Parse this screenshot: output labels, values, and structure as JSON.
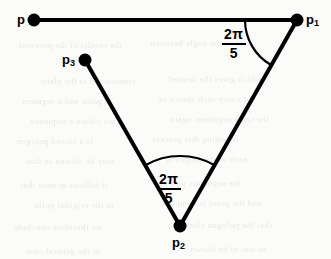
{
  "figure": {
    "background_color": "#fbfbfa",
    "ink_color": "#000000",
    "width": 331,
    "height": 259
  },
  "points": [
    {
      "id": "p",
      "label": "p",
      "subscript": "",
      "x": 34,
      "y": 20,
      "dot_radius": 6.5,
      "label_x": 17,
      "label_y": 13
    },
    {
      "id": "p1",
      "label": "p",
      "subscript": "1",
      "x": 297,
      "y": 20,
      "dot_radius": 6.5,
      "label_x": 306,
      "label_y": 13
    },
    {
      "id": "p3",
      "label": "p",
      "subscript": "3",
      "x": 85,
      "y": 60,
      "dot_radius": 6.5,
      "label_x": 62,
      "label_y": 53
    },
    {
      "id": "p2",
      "label": "p",
      "subscript": "2",
      "x": 180,
      "y": 226,
      "dot_radius": 6.5,
      "label_x": 172,
      "label_y": 236
    }
  ],
  "segments": [
    {
      "id": "p-to-p1",
      "from": "p",
      "to": "p1",
      "x1": 34,
      "y1": 20,
      "x2": 297,
      "y2": 20,
      "stroke_width": 4
    },
    {
      "id": "p1-to-p2",
      "from": "p1",
      "to": "p2",
      "x1": 297,
      "y1": 20,
      "x2": 180,
      "y2": 226,
      "stroke_width": 4
    },
    {
      "id": "p3-to-p2",
      "from": "p3",
      "to": "p2",
      "x1": 85,
      "y1": 60,
      "x2": 180,
      "y2": 226,
      "stroke_width": 4
    }
  ],
  "angles": [
    {
      "id": "angle-at-p1",
      "vertex": "p1",
      "numerator": "2π",
      "denominator": "5",
      "value_text": "2π/5",
      "arc_radius": 52,
      "label_x": 222,
      "label_y": 27
    },
    {
      "id": "angle-at-p2",
      "vertex": "p2",
      "numerator": "2π",
      "denominator": "5",
      "value_text": "2π/5",
      "arc_radius": 70,
      "label_x": 157,
      "label_y": 172
    }
  ],
  "bleed_text": [
    {
      "text": "the results of the previous",
      "x": 18,
      "y": 40,
      "size": 9
    },
    {
      "text": "and so the angle between",
      "x": 150,
      "y": 38,
      "size": 9
    },
    {
      "text": "constructed in the plane",
      "x": 40,
      "y": 76,
      "size": 9
    },
    {
      "text": "which gives the desired",
      "x": 168,
      "y": 74,
      "size": 9
    },
    {
      "text": "a point and a segment",
      "x": 22,
      "y": 96,
      "size": 9
    },
    {
      "text": "for every such choice of",
      "x": 158,
      "y": 94,
      "size": 9
    },
    {
      "text": "we obtain a sequence",
      "x": 30,
      "y": 116,
      "size": 9
    },
    {
      "text": "the same argument again",
      "x": 170,
      "y": 114,
      "size": 9
    },
    {
      "text": "is a closed polygon",
      "x": 16,
      "y": 136,
      "size": 9
    },
    {
      "text": "repeating this process",
      "x": 152,
      "y": 134,
      "size": 9
    },
    {
      "text": "may be chosen so that",
      "x": 26,
      "y": 156,
      "size": 9
    },
    {
      "text": "each of the angles is",
      "x": 166,
      "y": 154,
      "size": 9
    },
    {
      "text": "it follows at once that",
      "x": 20,
      "y": 180,
      "size": 9
    },
    {
      "text": "the segments join up",
      "x": 158,
      "y": 178,
      "size": 9
    },
    {
      "text": "to the original point",
      "x": 34,
      "y": 200,
      "size": 9
    },
    {
      "text": "and the proof is complete",
      "x": 160,
      "y": 198,
      "size": 9
    },
    {
      "text": "we therefore conclude",
      "x": 14,
      "y": 222,
      "size": 9
    },
    {
      "text": "that the polygon closes",
      "x": 180,
      "y": 220,
      "size": 9
    },
    {
      "text": "in the general case",
      "x": 26,
      "y": 246,
      "size": 9
    },
    {
      "text": "as was to be shown",
      "x": 190,
      "y": 244,
      "size": 9
    }
  ]
}
